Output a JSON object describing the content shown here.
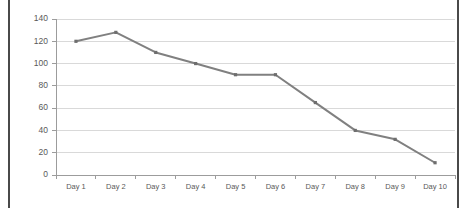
{
  "chart_data": {
    "type": "line",
    "title": "",
    "subtitle": "",
    "xlabel": "",
    "ylabel": "",
    "categories": [
      "Day 1",
      "Day 2",
      "Day 3",
      "Day 4",
      "Day 5",
      "Day 6",
      "Day 7",
      "Day 8",
      "Day 9",
      "Day 10"
    ],
    "series": [
      {
        "name": "Series 1",
        "values": [
          120,
          128,
          110,
          100,
          90,
          90,
          65,
          40,
          32,
          11
        ]
      }
    ],
    "values": [
      120,
      128,
      110,
      100,
      90,
      90,
      65,
      40,
      32,
      11
    ],
    "ylim": [
      0,
      140
    ],
    "ytick_labels": [
      "0",
      "20",
      "40",
      "60",
      "80",
      "100",
      "120",
      "140"
    ],
    "ytick_values": [
      0,
      20,
      40,
      60,
      80,
      100,
      120,
      140
    ],
    "grid": "horizontal",
    "legend": "none",
    "markers": "square",
    "colors": {
      "line": "#808080",
      "marker": "#6e6e6e",
      "gridline": "#d9d9d9",
      "axis": "#9c9c9c",
      "tick_text": "#595959",
      "plot_background": "#ffffff",
      "frame_border": "#4a4a4a"
    }
  },
  "axes": {
    "y": {
      "labels": [
        "140",
        "120",
        "100",
        "80",
        "60",
        "40",
        "20",
        "0"
      ]
    },
    "x": {
      "labels": [
        "Day 1",
        "Day 2",
        "Day 3",
        "Day 4",
        "Day 5",
        "Day 6",
        "Day 7",
        "Day 8",
        "Day 9",
        "Day 10"
      ]
    }
  }
}
